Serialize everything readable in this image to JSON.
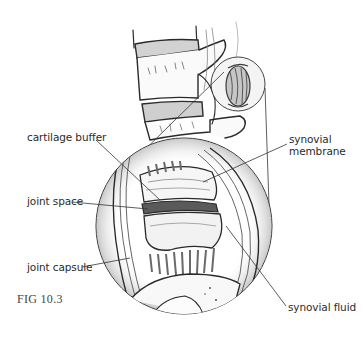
{
  "figure": {
    "caption": "FIG 10.3"
  },
  "labels": {
    "cartilage_buffer": "cartilage buffer",
    "synovial_membrane_line1": "synovial",
    "synovial_membrane_line2": "membrane",
    "joint_space": "joint space",
    "joint_capsule": "joint capsule",
    "synovial_fluid": "synovial fluid"
  },
  "colors": {
    "ink": "#2b2b2b",
    "background": "#ffffff",
    "cartilage_fill": "#cfcfcf"
  }
}
